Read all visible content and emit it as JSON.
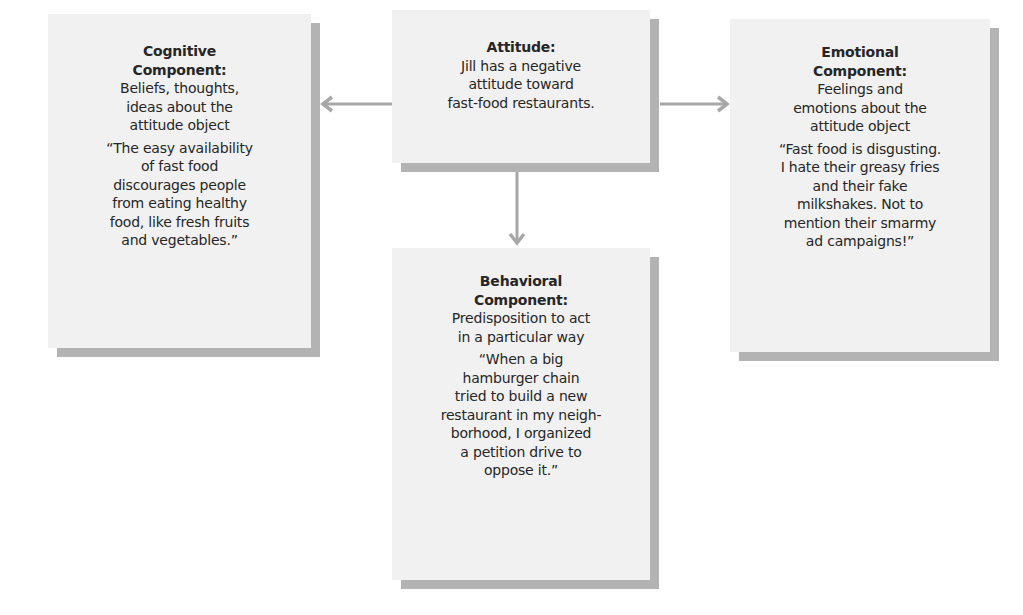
{
  "diagram": {
    "type": "concept-diagram",
    "colors": {
      "box_fill": "#f1f1f1",
      "box_shadow": "#b3b3b3",
      "arrow": "#a8a8a8",
      "text": "#262626"
    },
    "center": {
      "title": "Attitude:",
      "desc_lines": [
        "Jill has a negative",
        "attitude toward",
        "fast-food restaurants."
      ]
    },
    "cognitive": {
      "title_lines": [
        "Cognitive",
        "Component:"
      ],
      "desc_lines": [
        "Beliefs, thoughts,",
        "ideas about the",
        "attitude object"
      ],
      "quote_lines": [
        "“The easy availability",
        "of fast food",
        "discourages people",
        "from eating healthy",
        "food, like fresh fruits",
        "and vegetables.”"
      ]
    },
    "emotional": {
      "title_lines": [
        "Emotional",
        "Component:"
      ],
      "desc_lines": [
        "Feelings and",
        "emotions about the",
        "attitude object"
      ],
      "quote_lines": [
        "“Fast food is disgusting.",
        "I hate their greasy fries",
        "and their fake",
        "milkshakes. Not to",
        "mention their smarmy",
        "ad campaigns!”"
      ]
    },
    "behavioral": {
      "title_lines": [
        "Behavioral",
        "Component:"
      ],
      "desc_lines": [
        "Predisposition to act",
        "in a particular way"
      ],
      "quote_lines": [
        "“When a big",
        "hamburger chain",
        "tried to build a new",
        "restaurant in my neigh-",
        "borhood, I organized",
        "a petition drive to",
        "oppose it.”"
      ]
    },
    "edges": [
      {
        "from": "attitude",
        "to": "cognitive",
        "direction": "left"
      },
      {
        "from": "attitude",
        "to": "emotional",
        "direction": "right"
      },
      {
        "from": "attitude",
        "to": "behavioral",
        "direction": "down"
      }
    ]
  }
}
